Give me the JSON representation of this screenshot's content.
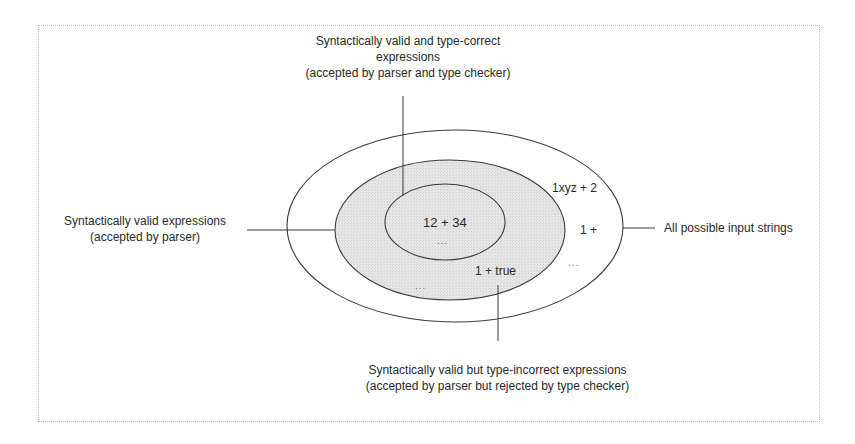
{
  "diagram": {
    "type": "nested-sets",
    "sets": [
      {
        "id": "all-inputs",
        "label": "All possible input strings",
        "examples": [
          "1xyz + 2",
          "1 +",
          "..."
        ]
      },
      {
        "id": "syntactically-valid",
        "label_line1": "Syntactically valid expressions",
        "label_line2": "(accepted by parser)",
        "examples": [
          "1 + true",
          "..."
        ]
      },
      {
        "id": "type-correct",
        "label_line1": "Syntactically valid and type-correct",
        "label_line2": "expressions",
        "label_line3": "(accepted by parser and type checker)",
        "examples": [
          "12 + 34",
          "..."
        ]
      }
    ],
    "bottom_label": {
      "line1": "Syntactically valid but type-incorrect expressions",
      "line2": "(accepted by parser but rejected by type checker)"
    },
    "colors": {
      "fill": "#e4e4e4",
      "stroke": "#3a3a3a",
      "frame": "#bdbdbd"
    }
  }
}
